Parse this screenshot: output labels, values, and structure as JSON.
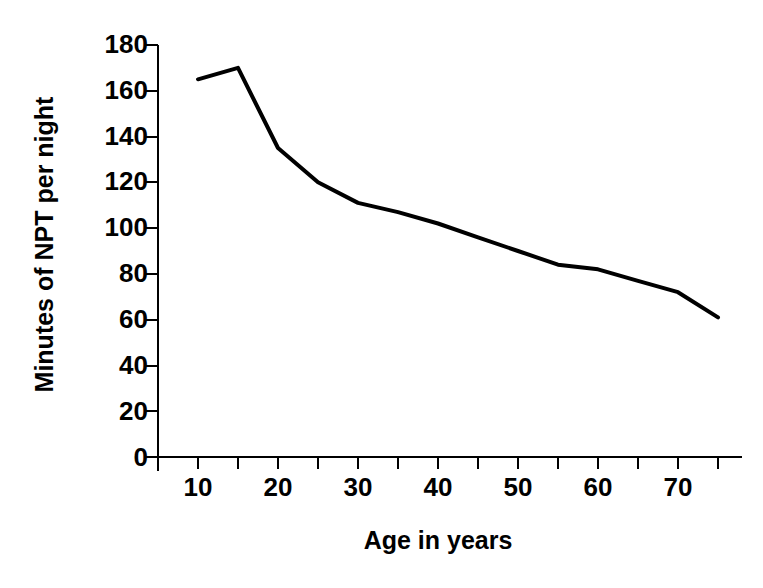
{
  "chart_data": {
    "type": "line",
    "title": "",
    "xlabel": "Age in years",
    "ylabel": "Minutes of NPT per night",
    "xlim": [
      5,
      75
    ],
    "ylim": [
      0,
      180
    ],
    "grid": false,
    "legend": null,
    "x_tick_labels": [
      "10",
      "20",
      "30",
      "40",
      "50",
      "60",
      "70"
    ],
    "x_major_ticks": [
      10,
      20,
      30,
      40,
      50,
      60,
      70
    ],
    "x_minor_ticks": [
      5,
      15,
      25,
      35,
      45,
      55,
      65,
      75
    ],
    "y_tick_labels": [
      "0",
      "20",
      "40",
      "60",
      "80",
      "100",
      "120",
      "140",
      "160",
      "180"
    ],
    "y_ticks": [
      0,
      20,
      40,
      60,
      80,
      100,
      120,
      140,
      160,
      180
    ],
    "series": [
      {
        "name": "Minutes of NPT per night",
        "color": "#000000",
        "x": [
          10,
          15,
          20,
          25,
          30,
          35,
          40,
          45,
          50,
          55,
          60,
          65,
          70,
          75
        ],
        "values": [
          165,
          170,
          135,
          120,
          111,
          107,
          102,
          96,
          90,
          84,
          82,
          77,
          72,
          61
        ]
      }
    ]
  },
  "axes": {
    "x_axis_name": "age-axis",
    "y_axis_name": "npt-axis"
  }
}
